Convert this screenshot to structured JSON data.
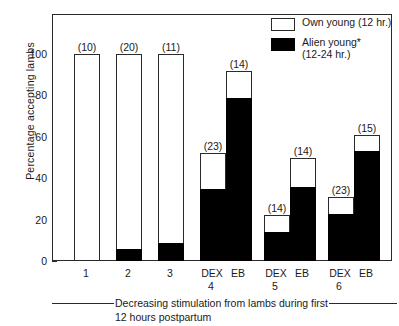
{
  "chart_data": {
    "type": "bar",
    "title": "",
    "subtitle": "",
    "xlabel": "Decreasing stimulation from lambs during first 12 hours postpartum",
    "ylabel": "Percentage accepting lambs",
    "ylim": [
      0,
      105
    ],
    "yticks": [
      0,
      20,
      40,
      60,
      80,
      100
    ],
    "ytick_labels": [
      "0",
      "20",
      "40",
      "60",
      "80",
      "100"
    ],
    "grid": false,
    "legend_position": "top-right",
    "stacked": true,
    "series": [
      {
        "name": "Own young (12 hr.)",
        "color": "#ffffff",
        "values": [
          100,
          100,
          100,
          52,
          92,
          22,
          50,
          31,
          61
        ]
      },
      {
        "name": "Alien young* (12-24 hr.)",
        "color": "#000000",
        "values": [
          0,
          6,
          9,
          35,
          79,
          14,
          36,
          23,
          53
        ]
      }
    ],
    "categories": [
      "1",
      "2",
      "3",
      "DEX",
      "EB",
      "DEX",
      "EB",
      "DEX",
      "EB"
    ],
    "sample_sizes": [
      "(10)",
      "(20)",
      "(11)",
      "(23)",
      "(14)",
      "(14)",
      "(14)",
      "(23)",
      "(15)"
    ],
    "group_numbers": [
      "1",
      "2",
      "3",
      "4",
      "5",
      "6"
    ]
  },
  "legend": {
    "entries": [
      {
        "label": "Own young (12 hr.)",
        "label_line2": "",
        "swatch": "open"
      },
      {
        "label": "Alien young*",
        "label_line2": "(12-24 hr.)",
        "swatch": "filled"
      }
    ]
  },
  "axes": {
    "y_title": "Percentage accepting lambs",
    "y_ticks": [
      "100",
      "80",
      "60",
      "40",
      "20",
      "0"
    ]
  },
  "x_axis": {
    "simple_labels": [
      "1",
      "2",
      "3"
    ],
    "treatment_labels": [
      "DEX",
      "EB",
      "DEX",
      "EB",
      "DEX",
      "EB"
    ],
    "group_numbers": [
      "4",
      "5",
      "6"
    ]
  },
  "caption": {
    "line1": "Decreasing stimulation from lambs during first",
    "line2": "12 hours postpartum"
  },
  "bars": [
    {
      "count": "(10)",
      "total": 100,
      "black": 0,
      "x": 73,
      "w": 26
    },
    {
      "count": "(20)",
      "total": 100,
      "black": 6,
      "x": 115,
      "w": 26
    },
    {
      "count": "(11)",
      "total": 100,
      "black": 9,
      "x": 157,
      "w": 26
    },
    {
      "count": "(23)",
      "total": 52,
      "black": 35,
      "x": 199,
      "w": 26
    },
    {
      "count": "(14)",
      "total": 92,
      "black": 79,
      "x": 225,
      "w": 26
    },
    {
      "count": "(14)",
      "total": 22,
      "black": 14,
      "x": 263,
      "w": 26
    },
    {
      "count": "(14)",
      "total": 50,
      "black": 36,
      "x": 289,
      "w": 26
    },
    {
      "count": "(23)",
      "total": 31,
      "black": 23,
      "x": 327,
      "w": 26
    },
    {
      "count": "(15)",
      "total": 61,
      "black": 53,
      "x": 353,
      "w": 26
    }
  ]
}
